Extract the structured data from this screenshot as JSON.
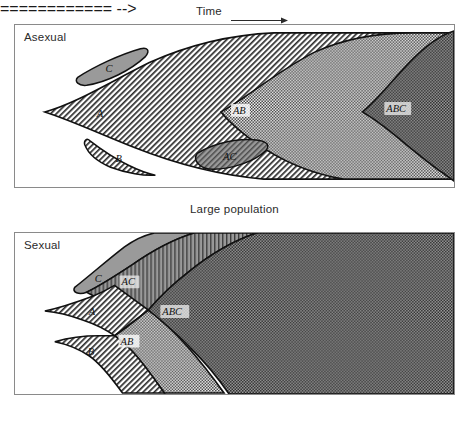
{
  "figure": {
    "top_caption": "Time",
    "top_caption_icon": "right-arrow-icon",
    "middle_caption": "Large population"
  },
  "panels": [
    {
      "id": "asexual",
      "title": "Asexual",
      "regions": [
        {
          "key": "C",
          "label": "C",
          "fill": "solid-gray",
          "shape": "lens"
        },
        {
          "key": "A",
          "label": "A",
          "fill": "diagonal-hatch",
          "shape": "wedge"
        },
        {
          "key": "B",
          "label": "B",
          "fill": "diagonal-hatch",
          "shape": "lens"
        },
        {
          "key": "AB",
          "label": "AB",
          "fill": "checker-light",
          "shape": "wedge"
        },
        {
          "key": "AC",
          "label": "AC",
          "fill": "gray-hatch",
          "shape": "lens"
        },
        {
          "key": "ABC",
          "label": "ABC",
          "fill": "checker-dark",
          "shape": "wedge"
        }
      ]
    },
    {
      "id": "sexual",
      "title": "Sexual",
      "regions": [
        {
          "key": "C",
          "label": "C",
          "fill": "solid-gray",
          "shape": "wedge"
        },
        {
          "key": "AC",
          "label": "AC",
          "fill": "gray-hatch",
          "shape": "wedge"
        },
        {
          "key": "A",
          "label": "A",
          "fill": "diagonal-hatch",
          "shape": "wedge"
        },
        {
          "key": "AB",
          "label": "AB",
          "fill": "checker-light",
          "shape": "wedge"
        },
        {
          "key": "B",
          "label": "B",
          "fill": "diagonal-hatch",
          "shape": "wedge"
        },
        {
          "key": "ABC",
          "label": "ABC",
          "fill": "checker-dark",
          "shape": "wedge"
        }
      ]
    }
  ],
  "colors": {
    "panel_border": "#8a8a8a",
    "outline": "#111111",
    "solid_gray": "#9a9a9a",
    "checker_dark": "#7f7f7f",
    "background": "#ffffff",
    "text": "#2b2b2b"
  }
}
